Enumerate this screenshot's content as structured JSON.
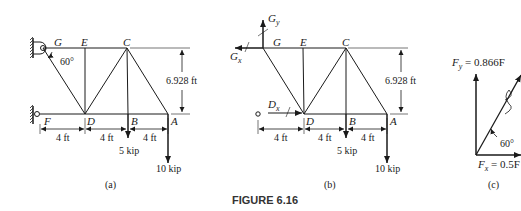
{
  "figure": {
    "caption": "FIGURE 6.16",
    "panels": {
      "a": {
        "label": "(a)",
        "nodes": {
          "G": "G",
          "E": "E",
          "C": "C",
          "F": "F",
          "D": "D",
          "B": "B",
          "A": "A"
        },
        "angle": "60°",
        "height_dim": "6.928 ft",
        "spans": [
          "4 ft",
          "4 ft",
          "4 ft"
        ],
        "loads": {
          "B": "5 kip",
          "A": "10 kip"
        }
      },
      "b": {
        "label": "(b)",
        "nodes": {
          "G": "G",
          "E": "E",
          "C": "C",
          "D": "D",
          "B": "B",
          "A": "A"
        },
        "reactions": {
          "Gy": "G",
          "Gy_sub": "y",
          "Gx": "G",
          "Gx_sub": "x",
          "Dx": "D",
          "Dx_sub": "x"
        },
        "height_dim": "6.928 ft",
        "spans": [
          "4 ft",
          "4 ft",
          "4 ft"
        ],
        "loads": {
          "B": "5 kip",
          "A": "10 kip"
        }
      },
      "c": {
        "label": "(c)",
        "fy_label": "F",
        "fy_sub": "y",
        "fy_value": " = 0.866F",
        "fx_label": "F",
        "fx_sub": "x",
        "fx_value": " = 0.5F",
        "angle": "60°"
      }
    }
  }
}
